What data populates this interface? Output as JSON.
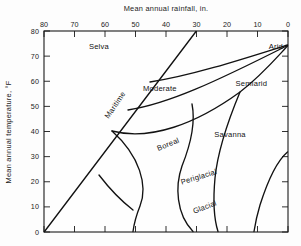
{
  "figure": {
    "kind": "morphogenetic-regions-diagram",
    "background_color": "#fdfdfd",
    "line_color": "#121212",
    "text_color": "#1b1b1b"
  },
  "chart_data": {
    "type": "line",
    "title": "Mean annual rainfall, in.",
    "xlabel": "Mean annual rainfall, in.",
    "ylabel": "Mean annual temperature, °F",
    "xlim": [
      80,
      0
    ],
    "ylim": [
      80,
      0
    ],
    "x_axis_position": "top",
    "x_axis_reversed": true,
    "y_axis_inverted": true,
    "grid": false,
    "legend": "none",
    "x_ticks": [
      80,
      70,
      60,
      50,
      40,
      30,
      20,
      10,
      0
    ],
    "x_tick_labels": [
      "80",
      "70",
      "60",
      "50",
      "40",
      "30",
      "20",
      "10",
      "0"
    ],
    "y_ticks": [
      0,
      10,
      20,
      30,
      40,
      50,
      60,
      70,
      80
    ],
    "y_tick_labels": [
      "0",
      "10",
      "20",
      "30",
      "40",
      "50",
      "60",
      "70",
      "80"
    ],
    "bottom_axis_ticks_labeled": false,
    "regions": [
      {
        "name": "Glacial",
        "label_x": 27,
        "label_y": 9,
        "rotation": -21
      },
      {
        "name": "Periglacial",
        "label_x": 29,
        "label_y": 21,
        "rotation": -17
      },
      {
        "name": "Boreal",
        "label_x": 39,
        "label_y": 34,
        "rotation": -22
      },
      {
        "name": "Maritime",
        "label_x": 56,
        "label_y": 50,
        "rotation": -56
      },
      {
        "name": "Savanna",
        "label_x": 19,
        "label_y": 38,
        "rotation": 0
      },
      {
        "name": "Moderate",
        "label_x": 42,
        "label_y": 56,
        "rotation": 0
      },
      {
        "name": "Semiarid",
        "label_x": 12,
        "label_y": 58,
        "rotation": 0
      },
      {
        "name": "Selva",
        "label_x": 62,
        "label_y": 73,
        "rotation": 0
      },
      {
        "name": "Arid",
        "label_x": 4,
        "label_y": 73,
        "rotation": 0
      }
    ]
  }
}
